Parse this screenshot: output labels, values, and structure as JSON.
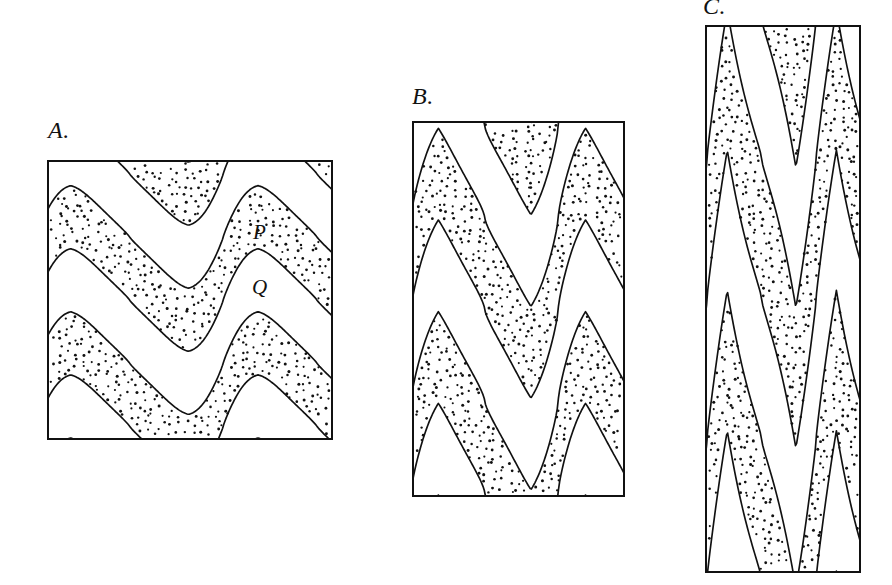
{
  "figure": {
    "background_color": "#ffffff",
    "line_color": "#111111",
    "stipple_color": "#111111",
    "unshaded_color": "#ffffff"
  },
  "panels": [
    {
      "id": "A",
      "label": "A.",
      "label_x": 48,
      "label_y": 118,
      "frame": {
        "x": 47,
        "y": 160,
        "width": 286,
        "height": 280
      },
      "fold_style": "open asymmetric folds",
      "wavelength": 190,
      "amplitude": 52,
      "layers": 7,
      "bed_labels": [
        {
          "text": "P",
          "x": 253,
          "y": 222,
          "bed": "stippled"
        },
        {
          "text": "Q",
          "x": 252,
          "y": 277,
          "bed": "unshaded"
        }
      ]
    },
    {
      "id": "B",
      "label": "B.",
      "label_x": 412,
      "label_y": 84,
      "frame": {
        "x": 412,
        "y": 121,
        "width": 213,
        "height": 376
      },
      "fold_style": "tighter asymmetric folds",
      "wavelength": 150,
      "amplitude": 90,
      "layers": 7,
      "bed_labels": []
    },
    {
      "id": "C",
      "label": "C.",
      "label_x": 703,
      "label_y": -6,
      "frame": {
        "x": 705,
        "y": 25,
        "width": 156,
        "height": 548
      },
      "fold_style": "chevron / near-isoclinal folds",
      "wavelength": 112,
      "amplitude": 150,
      "layers": 7,
      "bed_labels": []
    }
  ],
  "chart_data": {
    "type": "diagram",
    "series": [
      {
        "name": "A",
        "label": "A.",
        "fold_tightness": "open",
        "interlimb_angle_deg": 120,
        "shortening_percent": 0
      },
      {
        "name": "B",
        "label": "B.",
        "fold_tightness": "close",
        "interlimb_angle_deg": 60,
        "shortening_percent": 35
      },
      {
        "name": "C",
        "label": "C.",
        "fold_tightness": "tight / isoclinal chevron",
        "interlimb_angle_deg": 20,
        "shortening_percent": 60
      }
    ],
    "annotations": [
      "P",
      "Q"
    ],
    "legend": [
      {
        "label": "stippled bed",
        "pattern": "dot stipple"
      },
      {
        "label": "unshaded bed",
        "pattern": "white"
      }
    ]
  }
}
